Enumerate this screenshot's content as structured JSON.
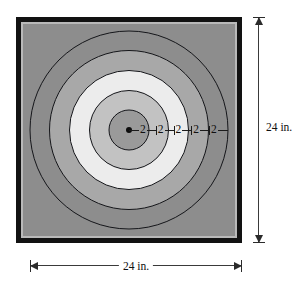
{
  "figure": {
    "kind": "concentric-circle-target-diagram",
    "plate": {
      "frame_color": "#121212",
      "inner_border_color": "#b9b9b9",
      "face_color": "#8d8d8d"
    },
    "center_marker": {
      "name": "center-point",
      "color": "#0c0c0c"
    },
    "rings": [
      {
        "index": 1,
        "label": "outermost-ring",
        "diameter_in": 20,
        "fill": "#8d8d8d",
        "stroke": "#15161a"
      },
      {
        "index": 2,
        "label": "fourth-ring",
        "diameter_in": 16,
        "fill": "#a8a8a8",
        "stroke": "#15161a"
      },
      {
        "index": 3,
        "label": "third-ring",
        "diameter_in": 12,
        "fill": "#ececec",
        "stroke": "#15161a"
      },
      {
        "index": 4,
        "label": "second-ring",
        "diameter_in": 8,
        "fill": "#c2c2c2",
        "stroke": "#15161a"
      },
      {
        "index": 5,
        "label": "bullseye",
        "diameter_in": 4,
        "fill": "#9a9a9a",
        "stroke": "#15161a"
      }
    ],
    "radial_dimensions": {
      "unit_note": "each segment equals 2 in.",
      "segments": [
        "2",
        "2",
        "2",
        "2",
        "2"
      ]
    },
    "overall_dimensions": {
      "vertical": {
        "label": "24 in.",
        "value": 24,
        "unit": "in."
      },
      "horizontal": {
        "label": "24 in.",
        "value": 24,
        "unit": "in."
      }
    }
  }
}
